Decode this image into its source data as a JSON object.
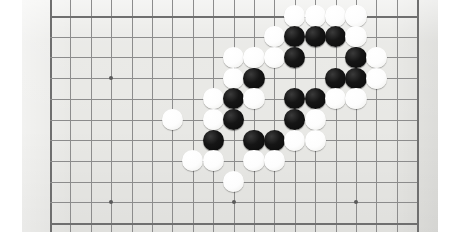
{
  "scene": {
    "kind": "go-board-photograph",
    "description": "Close-up photograph of a Go (Baduk) board with black and white stones",
    "board_size": 19,
    "visible_columns": 19,
    "visible_rows": 11,
    "colors": {
      "board": "#e8e8e5",
      "grid_line": "#8c8c8c",
      "edge_line": "#6f6f6f",
      "black_stone": "#111111",
      "white_stone": "#fdfdfd",
      "page": "#ffffff"
    }
  },
  "board": {
    "origin_x": 28,
    "origin_y": 16,
    "spacing_x": 20.4,
    "spacing_y": 20.7,
    "cols": 19,
    "rows": 11,
    "stone_radius": 10.6,
    "hoshi": [
      {
        "col": 4,
        "row": 4
      },
      {
        "col": 10,
        "row": 4
      },
      {
        "col": 16,
        "row": 4
      },
      {
        "col": 4,
        "row": 10
      },
      {
        "col": 10,
        "row": 10
      },
      {
        "col": 16,
        "row": 10
      }
    ],
    "stones": [
      {
        "col": 13,
        "row": 1,
        "color": "white"
      },
      {
        "col": 14,
        "row": 1,
        "color": "white"
      },
      {
        "col": 15,
        "row": 1,
        "color": "white"
      },
      {
        "col": 16,
        "row": 1,
        "color": "white"
      },
      {
        "col": 12,
        "row": 2,
        "color": "white"
      },
      {
        "col": 13,
        "row": 2,
        "color": "black"
      },
      {
        "col": 14,
        "row": 2,
        "color": "black"
      },
      {
        "col": 15,
        "row": 2,
        "color": "black"
      },
      {
        "col": 16,
        "row": 2,
        "color": "white"
      },
      {
        "col": 10,
        "row": 3,
        "color": "white"
      },
      {
        "col": 11,
        "row": 3,
        "color": "white"
      },
      {
        "col": 12,
        "row": 3,
        "color": "white"
      },
      {
        "col": 13,
        "row": 3,
        "color": "black"
      },
      {
        "col": 16,
        "row": 3,
        "color": "black"
      },
      {
        "col": 17,
        "row": 3,
        "color": "white"
      },
      {
        "col": 10,
        "row": 4,
        "color": "white"
      },
      {
        "col": 11,
        "row": 4,
        "color": "black"
      },
      {
        "col": 15,
        "row": 4,
        "color": "black"
      },
      {
        "col": 16,
        "row": 4,
        "color": "black"
      },
      {
        "col": 17,
        "row": 4,
        "color": "white"
      },
      {
        "col": 9,
        "row": 5,
        "color": "white"
      },
      {
        "col": 10,
        "row": 5,
        "color": "black"
      },
      {
        "col": 11,
        "row": 5,
        "color": "white"
      },
      {
        "col": 13,
        "row": 5,
        "color": "black"
      },
      {
        "col": 14,
        "row": 5,
        "color": "black"
      },
      {
        "col": 15,
        "row": 5,
        "color": "white"
      },
      {
        "col": 16,
        "row": 5,
        "color": "white"
      },
      {
        "col": 7,
        "row": 6,
        "color": "white"
      },
      {
        "col": 9,
        "row": 6,
        "color": "white"
      },
      {
        "col": 10,
        "row": 6,
        "color": "black"
      },
      {
        "col": 13,
        "row": 6,
        "color": "black"
      },
      {
        "col": 14,
        "row": 6,
        "color": "white"
      },
      {
        "col": 9,
        "row": 7,
        "color": "black"
      },
      {
        "col": 11,
        "row": 7,
        "color": "black"
      },
      {
        "col": 12,
        "row": 7,
        "color": "black"
      },
      {
        "col": 13,
        "row": 7,
        "color": "white"
      },
      {
        "col": 14,
        "row": 7,
        "color": "white"
      },
      {
        "col": 8,
        "row": 8,
        "color": "white"
      },
      {
        "col": 9,
        "row": 8,
        "color": "white"
      },
      {
        "col": 11,
        "row": 8,
        "color": "white"
      },
      {
        "col": 12,
        "row": 8,
        "color": "white"
      },
      {
        "col": 10,
        "row": 9,
        "color": "white"
      }
    ]
  }
}
